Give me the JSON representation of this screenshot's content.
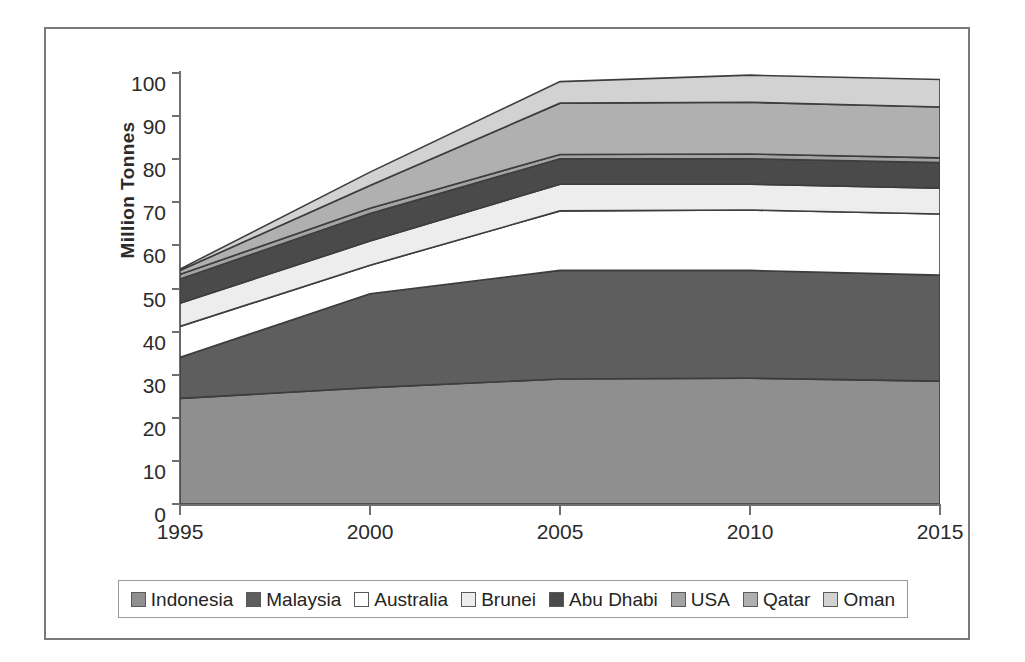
{
  "chart_data": {
    "type": "area",
    "stacked": true,
    "title": "",
    "xlabel": "",
    "ylabel": "Million Tonnes",
    "x": [
      1995,
      2000,
      2005,
      2010,
      2015
    ],
    "xtick_labels": [
      "1995",
      "2000",
      "2005",
      "2010",
      "2015"
    ],
    "ytick_labels": [
      "0",
      "10",
      "20",
      "30",
      "40",
      "50",
      "60",
      "70",
      "80",
      "90",
      "100"
    ],
    "ylim": [
      0,
      100
    ],
    "xlim": [
      1995,
      2015
    ],
    "grid": false,
    "legend_position": "bottom",
    "series": [
      {
        "name": "Indonesia",
        "color": "#8f8f8f",
        "values": [
          24.5,
          27.0,
          29.0,
          29.2,
          28.5
        ]
      },
      {
        "name": "Malaysia",
        "color": "#5e5e5e",
        "values": [
          9.5,
          21.8,
          25.2,
          25.0,
          24.6
        ]
      },
      {
        "name": "Australia",
        "color": "#ffffff",
        "values": [
          7.2,
          6.6,
          13.8,
          14.0,
          14.2
        ]
      },
      {
        "name": "Brunei",
        "color": "#ededed",
        "values": [
          5.4,
          5.6,
          6.2,
          6.0,
          6.0
        ]
      },
      {
        "name": "Abu Dhabi",
        "color": "#4a4a4a",
        "values": [
          5.6,
          6.4,
          5.9,
          5.9,
          5.9
        ]
      },
      {
        "name": "USA",
        "color": "#a3a3a3",
        "values": [
          1.1,
          1.2,
          1.0,
          1.1,
          1.1
        ]
      },
      {
        "name": "Qatar",
        "color": "#b0b0b0",
        "values": [
          0.9,
          5.3,
          11.9,
          12.0,
          11.8
        ]
      },
      {
        "name": "Oman",
        "color": "#d2d2d2",
        "values": [
          0.3,
          3.1,
          5.0,
          6.3,
          6.4
        ]
      }
    ],
    "totals": [
      54.5,
      77.0,
      98.0,
      99.5,
      98.5
    ]
  },
  "axis": {
    "ylabel": "Million Tonnes"
  },
  "legend": {
    "items": [
      {
        "label": "Indonesia"
      },
      {
        "label": "Malaysia"
      },
      {
        "label": "Australia"
      },
      {
        "label": "Brunei"
      },
      {
        "label": "Abu Dhabi"
      },
      {
        "label": "USA"
      },
      {
        "label": "Qatar"
      },
      {
        "label": "Oman"
      }
    ]
  }
}
